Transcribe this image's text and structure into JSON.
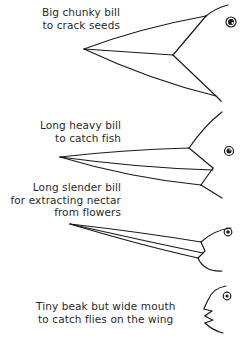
{
  "diagram": {
    "type": "bird-bill-adaptations",
    "birds": [
      {
        "id": "seed-eater",
        "caption_lines": [
          "Big chunky bill",
          "to crack seeds"
        ]
      },
      {
        "id": "fish-eater",
        "caption_lines": [
          "Long heavy bill",
          "to catch fish"
        ]
      },
      {
        "id": "nectar-feeder",
        "caption_lines": [
          "Long slender bill",
          "for extracting nectar",
          "from flowers"
        ]
      },
      {
        "id": "insect-catcher",
        "caption_lines": [
          "Tiny beak but wide mouth",
          "to catch flies on the wing"
        ]
      }
    ],
    "colors": {
      "ink": "#1a1a1a",
      "text": "#2a2a2a",
      "background": "#ffffff"
    }
  }
}
